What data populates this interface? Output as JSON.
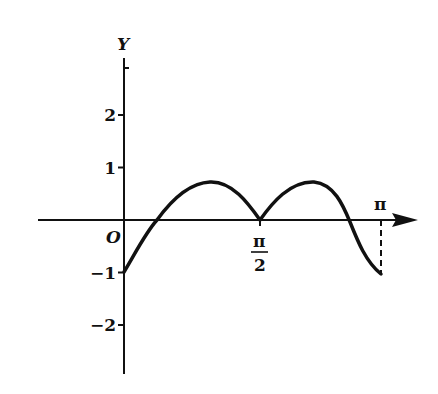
{
  "chart_data": {
    "type": "line",
    "title": "",
    "xlabel": "",
    "ylabel": "Y",
    "origin_label": "O",
    "x_ticks": [
      {
        "value": 1.5708,
        "label_num": "π",
        "label_den": "2"
      },
      {
        "value": 3.1416,
        "label": "π"
      }
    ],
    "y_ticks": [
      {
        "value": 2,
        "label": "2"
      },
      {
        "value": 1,
        "label": "1"
      },
      {
        "value": -1,
        "label": "−1"
      },
      {
        "value": -2,
        "label": "−2"
      }
    ],
    "xlim": [
      -0.8,
      3.4
    ],
    "ylim": [
      -2.9,
      3.0
    ],
    "grid": false,
    "series": [
      {
        "name": "curve",
        "x": [
          0,
          0.2,
          0.4,
          0.6,
          0.8,
          1.0,
          1.2,
          1.4,
          1.5708,
          1.75,
          1.95,
          2.15,
          2.35,
          2.6,
          2.8,
          3.0,
          3.1416
        ],
        "y": [
          -1.0,
          -0.55,
          -0.05,
          0.35,
          0.62,
          0.7,
          0.58,
          0.3,
          0.0,
          0.35,
          0.62,
          0.7,
          0.55,
          0.05,
          -0.55,
          -0.9,
          -1.0
        ]
      }
    ],
    "annotations": [
      {
        "type": "dashed-vertical",
        "x": 3.1416,
        "from_y": 0,
        "to_y": -1.0
      }
    ]
  }
}
